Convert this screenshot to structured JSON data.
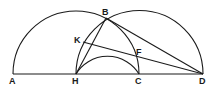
{
  "diagram": {
    "type": "geometric-construction",
    "points": {
      "A": {
        "label": "A",
        "x": 13,
        "y": 74
      },
      "H": {
        "label": "H",
        "x": 76,
        "y": 74
      },
      "C": {
        "label": "C",
        "x": 139,
        "y": 74
      },
      "D": {
        "label": "D",
        "x": 203,
        "y": 74
      },
      "B": {
        "label": "B",
        "x": 106,
        "y": 18
      },
      "K": {
        "label": "K",
        "x": 83,
        "y": 42
      },
      "F": {
        "label": "F",
        "x": 137,
        "y": 57
      }
    },
    "segments": [
      [
        "A",
        "D"
      ],
      [
        "H",
        "B"
      ],
      [
        "B",
        "D"
      ],
      [
        "K",
        "D"
      ],
      [
        "B",
        "K"
      ]
    ],
    "arcs": [
      {
        "name": "semicircle-AC",
        "from": "A",
        "to": "C"
      },
      {
        "name": "semicircle-HD",
        "from": "H",
        "to": "D"
      },
      {
        "name": "arc-HBC",
        "from": "H",
        "via": "B",
        "to": "C"
      }
    ]
  },
  "labels": {
    "A": "A",
    "H": "H",
    "C": "C",
    "D": "D",
    "B": "B",
    "K": "K",
    "F": "F"
  }
}
